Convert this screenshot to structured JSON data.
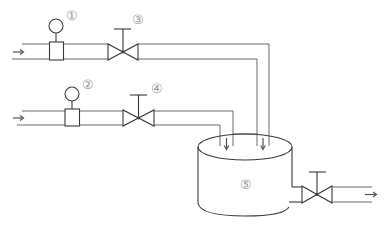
{
  "diagram": {
    "type": "process-flow (P&ID style)",
    "labels": {
      "gauge_1": "①",
      "gauge_2": "②",
      "valve_3": "③",
      "valve_4": "④",
      "tank_5": "⑤"
    },
    "components": [
      {
        "id": "gauge_1",
        "kind": "pressure-gauge / flow meter",
        "label": "①",
        "line": "upper inlet"
      },
      {
        "id": "gauge_2",
        "kind": "pressure-gauge / flow meter",
        "label": "②",
        "line": "lower inlet"
      },
      {
        "id": "valve_3",
        "kind": "gate valve",
        "label": "③",
        "line": "upper inlet"
      },
      {
        "id": "valve_4",
        "kind": "gate valve",
        "label": "④",
        "line": "lower inlet"
      },
      {
        "id": "tank_5",
        "kind": "mixing tank",
        "label": "⑤"
      },
      {
        "id": "valve_out",
        "kind": "gate valve",
        "label": "",
        "line": "outlet"
      }
    ],
    "flows": [
      {
        "from": "upper inlet",
        "through": [
          "gauge_1",
          "valve_3"
        ],
        "to": "tank_5",
        "direction": "right-then-down"
      },
      {
        "from": "lower inlet",
        "through": [
          "gauge_2",
          "valve_4"
        ],
        "to": "tank_5",
        "direction": "right-then-down"
      },
      {
        "from": "tank_5",
        "through": [
          "valve_out"
        ],
        "to": "outlet",
        "direction": "right"
      }
    ],
    "colors": {
      "line": "#3a3a3a",
      "pipe": "#6a6a6a",
      "label": "#9a9a9a",
      "background": "#ffffff"
    }
  }
}
